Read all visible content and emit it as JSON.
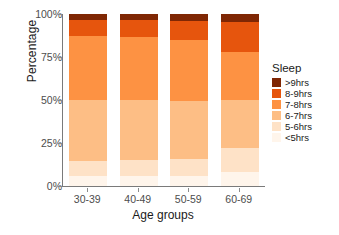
{
  "chart_data": {
    "type": "bar",
    "stacked": true,
    "title": "",
    "xlabel": "Age groups",
    "ylabel": "Percentage",
    "categories": [
      "30-39",
      "40-49",
      "50-59",
      "60-69"
    ],
    "ytick_labels": [
      "0%",
      "25%",
      "50%",
      "75%",
      "100%"
    ],
    "ytick_values": [
      0,
      25,
      50,
      75,
      100
    ],
    "ylim": [
      0,
      100
    ],
    "grid": false,
    "legend_title": "Sleep",
    "legend_position": "right",
    "series": [
      {
        "name": ">9hrs",
        "color": "#7f2704",
        "values": [
          3.5,
          3.5,
          4.0,
          4.5
        ]
      },
      {
        "name": "8-9hrs",
        "color": "#e6550d",
        "values": [
          9.5,
          10.0,
          11.0,
          17.5
        ]
      },
      {
        "name": "7-8hrs",
        "color": "#fd9243",
        "values": [
          37.0,
          36.5,
          35.5,
          28.0
        ]
      },
      {
        "name": "6-7hrs",
        "color": "#fdbe85",
        "values": [
          35.5,
          35.0,
          34.0,
          28.0
        ]
      },
      {
        "name": "5-6hrs",
        "color": "#fee2c7",
        "values": [
          8.5,
          9.0,
          9.5,
          14.0
        ]
      },
      {
        "name": "<5hrs",
        "color": "#fff5eb",
        "values": [
          6.0,
          6.0,
          6.0,
          8.0
        ]
      }
    ]
  },
  "legend": {
    "title": "Sleep",
    "items": [
      {
        "label": ">9hrs",
        "color": "#7f2704"
      },
      {
        "label": "8-9hrs",
        "color": "#e6550d"
      },
      {
        "label": "7-8hrs",
        "color": "#fd9243"
      },
      {
        "label": "6-7hrs",
        "color": "#fdbe85"
      },
      {
        "label": "5-6hrs",
        "color": "#fee2c7"
      },
      {
        "label": "<5hrs",
        "color": "#fff5eb"
      }
    ]
  },
  "axes": {
    "y_title": "Percentage",
    "x_title": "Age groups"
  }
}
